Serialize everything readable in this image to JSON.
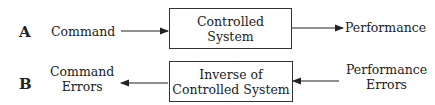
{
  "row_a": {
    "label": "A",
    "input": "Command",
    "box_line1": "Controlled",
    "box_line2": "System",
    "output": "Performance"
  },
  "row_b": {
    "label": "B",
    "output_line1": "Command",
    "output_line2": "Errors",
    "box_line1": "Inverse of",
    "box_line2": "Controlled System",
    "input_line1": "Performance",
    "input_line2": "Errors"
  }
}
